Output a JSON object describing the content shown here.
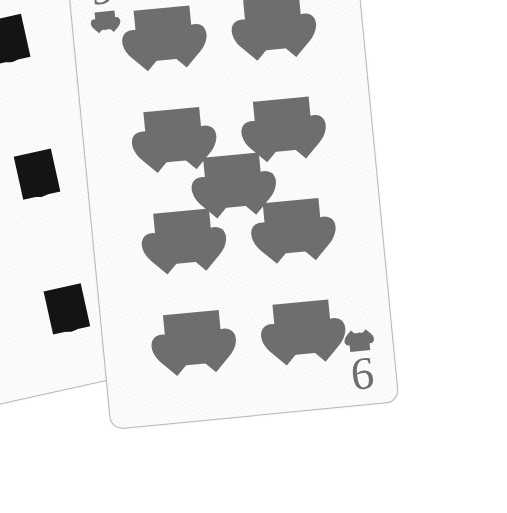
{
  "image": {
    "kind": "photograph",
    "subject": "three fanned playing cards on a white background",
    "background_color": "#ffffff",
    "palette": {
      "card_face": "#fdfdfd",
      "card_edge": "#b9b9b9",
      "red_suit_gray": "#6f6f6f",
      "black_suit": "#141414",
      "caption_text": "#3a3a3a"
    }
  },
  "caption": {
    "text": "lding",
    "note": "partially cropped word at the upper-left edge"
  },
  "cards": [
    {
      "id": "card-6d",
      "name": "six-of-diamonds",
      "rank": "6",
      "suit": "diamonds",
      "suit_symbol": "♦",
      "suit_color": "#6f6f6f",
      "position": "back-left",
      "rotation_deg": -20.5,
      "corner_index_top": "6",
      "corner_index_bottom": "6",
      "pip_count": 6,
      "visible_portion": "left edge strip with top and bottom corner indices"
    },
    {
      "id": "card-3s",
      "name": "three-of-spades",
      "rank": "3",
      "suit": "spades",
      "suit_symbol": "♠",
      "suit_color": "#141414",
      "position": "middle",
      "rotation_deg": -12.5,
      "corner_index_top": "3",
      "corner_index_bottom": "3",
      "pip_count": 3,
      "visible_portion": "narrow strip with top and bottom corner indices"
    },
    {
      "id": "card-9h",
      "name": "nine-of-hearts",
      "rank": "9",
      "suit": "hearts",
      "suit_symbol": "♥",
      "suit_color": "#6f6f6f",
      "position": "front-right",
      "rotation_deg": -5.5,
      "corner_index_top": "9",
      "corner_index_bottom": "9",
      "pip_count": 9,
      "visible_portion": "fully visible face with nine heart pips"
    }
  ]
}
